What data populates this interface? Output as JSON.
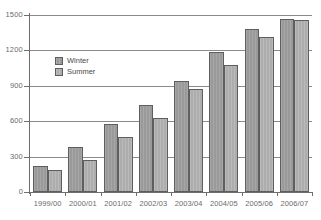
{
  "chart_data": {
    "type": "bar",
    "title": "",
    "subtitle": "",
    "xlabel": "",
    "ylabel": "",
    "categories": [
      "1999/00",
      "2000/01",
      "2001/02",
      "2002/03",
      "2003/04",
      "2004/05",
      "2005/06",
      "2006/07"
    ],
    "series": [
      {
        "name": "Winter",
        "color": "#9a9a9a",
        "values": [
          220,
          380,
          580,
          740,
          945,
          1190,
          1380,
          1465
        ]
      },
      {
        "name": "Summer",
        "color": "#adadad",
        "values": [
          185,
          275,
          465,
          625,
          875,
          1080,
          1310,
          1455
        ]
      }
    ],
    "ylim": [
      0,
      1500
    ],
    "yticks": [
      0,
      300,
      600,
      900,
      1200,
      1500
    ],
    "ytick_labels": [
      "0",
      "300",
      "600",
      "900",
      "1200",
      "1500"
    ],
    "grid": true,
    "grid_axis": "y",
    "legend_position": "upper left",
    "legend_entries": [
      "Winter",
      "Summer"
    ],
    "annotations": []
  },
  "axis": {
    "y_axis_name": "y-axis",
    "x_axis_name": "x-axis"
  },
  "legend": {
    "winter_label": "Winter",
    "summer_label": "Summer"
  }
}
